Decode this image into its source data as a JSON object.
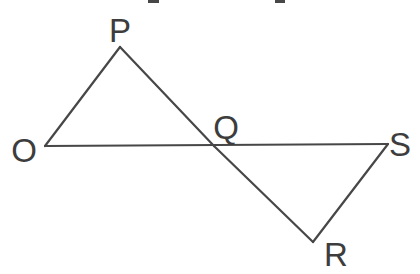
{
  "figure": {
    "type": "geometry-diagram",
    "background_color": "#ffffff",
    "line_color": "#474747",
    "label_color": "#3d3d3d",
    "line_width": 2.2,
    "points": {
      "O": {
        "x": 45,
        "y": 146
      },
      "P": {
        "x": 120,
        "y": 47
      },
      "Q": {
        "x": 214,
        "y": 146
      },
      "R": {
        "x": 313,
        "y": 242
      },
      "S": {
        "x": 388,
        "y": 144
      }
    },
    "segments": [
      {
        "from": "O",
        "to": "P"
      },
      {
        "from": "P",
        "to": "Q"
      },
      {
        "from": "Q",
        "to": "R"
      },
      {
        "from": "O",
        "to": "S"
      },
      {
        "from": "S",
        "to": "R"
      }
    ],
    "labels": [
      {
        "text": "O",
        "x": 24,
        "y": 162,
        "anchor": "middle"
      },
      {
        "text": "P",
        "x": 120,
        "y": 42,
        "anchor": "middle"
      },
      {
        "text": "Q",
        "x": 226,
        "y": 139,
        "anchor": "middle"
      },
      {
        "text": "S",
        "x": 400,
        "y": 156,
        "anchor": "middle"
      },
      {
        "text": "R",
        "x": 336,
        "y": 266,
        "anchor": "middle"
      }
    ],
    "crop_artifacts": [
      {
        "x": 148,
        "y": 0,
        "width": 11,
        "height": 3
      },
      {
        "x": 275,
        "y": 0,
        "width": 10,
        "height": 3
      }
    ]
  }
}
